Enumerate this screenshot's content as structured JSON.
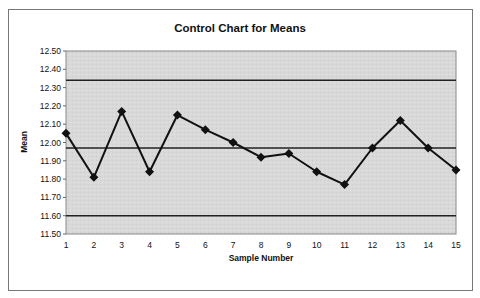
{
  "chart_data": {
    "type": "line",
    "title": "Control Chart for Means",
    "xlabel": "Sample Number",
    "ylabel": "Mean",
    "x": [
      1,
      2,
      3,
      4,
      5,
      6,
      7,
      8,
      9,
      10,
      11,
      12,
      13,
      14,
      15
    ],
    "series": [
      {
        "name": "Sample Mean",
        "marker": "diamond",
        "values": [
          12.05,
          11.81,
          12.17,
          11.84,
          12.15,
          12.07,
          12.0,
          11.92,
          11.94,
          11.84,
          11.77,
          11.97,
          12.12,
          11.97,
          11.85
        ]
      }
    ],
    "reference_lines": [
      {
        "name": "UCL",
        "value": 12.34
      },
      {
        "name": "Center Line",
        "value": 11.97
      },
      {
        "name": "LCL",
        "value": 11.6
      }
    ],
    "ylim": [
      11.5,
      12.5
    ],
    "yticks": [
      "11.50",
      "11.60",
      "11.70",
      "11.80",
      "11.90",
      "12.00",
      "12.10",
      "12.20",
      "12.30",
      "12.40",
      "12.50"
    ],
    "xticks": [
      "1",
      "2",
      "3",
      "4",
      "5",
      "6",
      "7",
      "8",
      "9",
      "10",
      "11",
      "12",
      "13",
      "14",
      "15"
    ],
    "grid": false,
    "legend": "none",
    "colors": {
      "plot_background": "#d9d9d9",
      "line": "#111111",
      "reference_line": "#222222",
      "border": "#777777"
    }
  }
}
